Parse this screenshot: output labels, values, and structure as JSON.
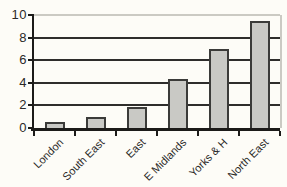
{
  "chart_data": {
    "type": "bar",
    "categories": [
      "London",
      "South East",
      "East",
      "E Midlands",
      "Yorks & H",
      "North East"
    ],
    "values": [
      0.5,
      1.0,
      1.9,
      4.3,
      7.0,
      9.5
    ],
    "title": "",
    "xlabel": "",
    "ylabel": "",
    "ylim": [
      0,
      10
    ],
    "yticks": [
      0,
      2,
      4,
      6,
      8,
      10
    ],
    "grid": "horizontal",
    "legend": "none",
    "colors": {
      "bar_fill": "#c9c9c5",
      "bar_border": "#3b3b39",
      "gridline_dark": "#2e2d2b",
      "gridline_light": "#cbcac3",
      "axis": "#1c1b19",
      "text": "#2a2927",
      "background": "#fdfcf7"
    }
  }
}
